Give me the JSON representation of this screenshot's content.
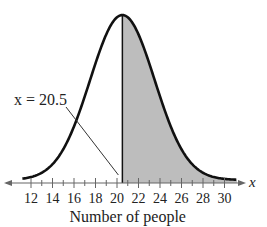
{
  "chart_data": {
    "type": "area",
    "title": "",
    "xlabel": "Number of people",
    "ylabel": "",
    "axis_symbol": "x",
    "x_ticks": [
      12,
      14,
      16,
      18,
      20,
      22,
      24,
      26,
      28,
      30
    ],
    "xlim": [
      10.5,
      31.5
    ],
    "distribution": "normal",
    "mean": 20.5,
    "std": 3.0,
    "shaded_region": {
      "from": 20.5,
      "to": "infinity"
    },
    "annotation": "x = 20.5",
    "annotation_x": 20.5
  }
}
